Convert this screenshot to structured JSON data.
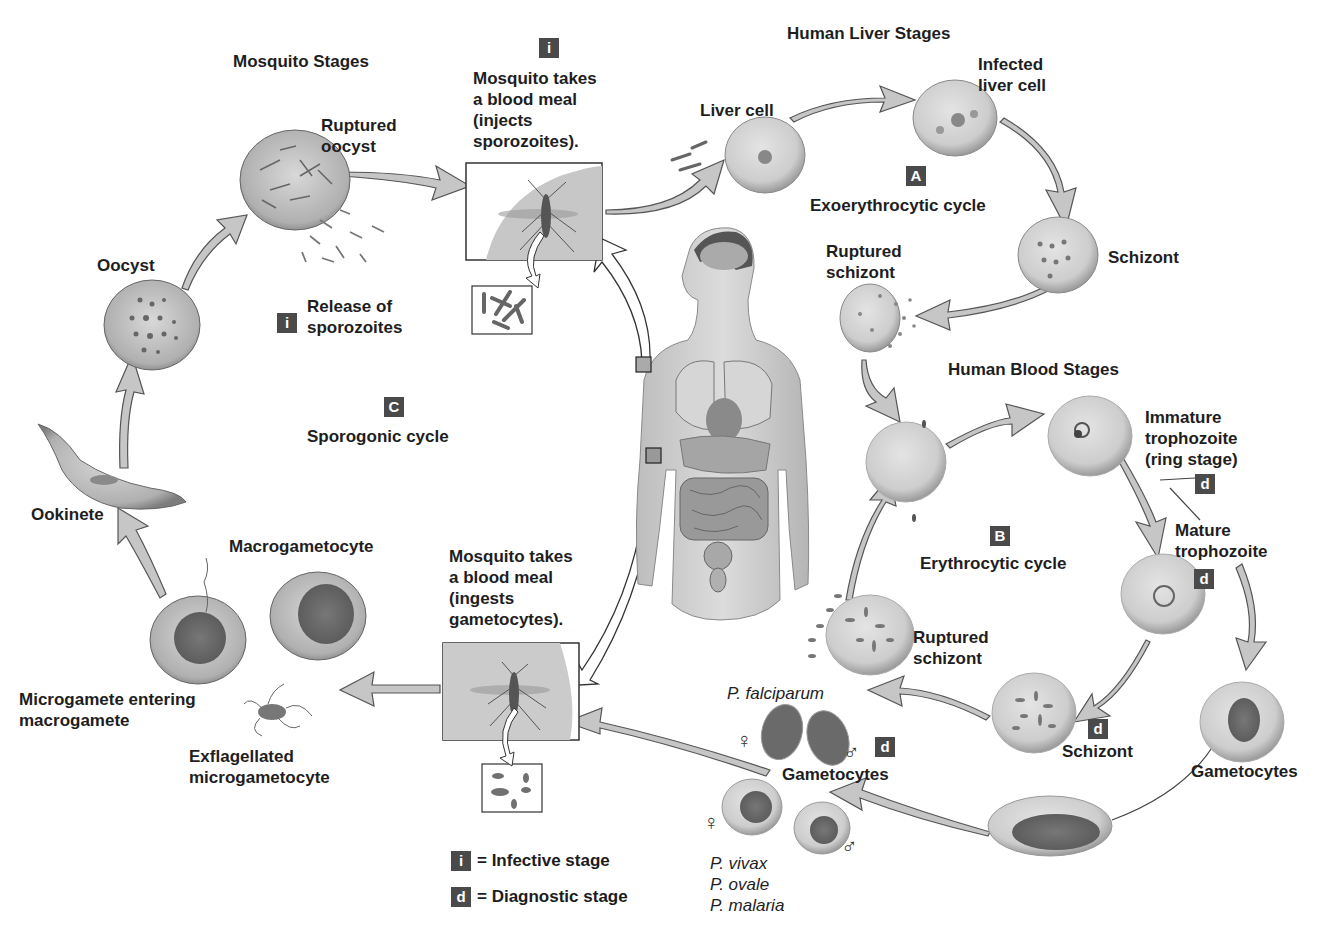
{
  "sections": {
    "mosquito": "Mosquito Stages",
    "liver": "Human Liver Stages",
    "blood": "Human Blood Stages"
  },
  "cycles": {
    "A": {
      "badge": "A",
      "label": "Exoerythrocytic cycle"
    },
    "B": {
      "badge": "B",
      "label": "Erythrocytic cycle"
    },
    "C": {
      "badge": "C",
      "label": "Sporogonic cycle"
    }
  },
  "labels": {
    "bite_inject": [
      "Mosquito takes",
      "a blood meal",
      "(injects",
      "sporozoites)."
    ],
    "bite_ingest": [
      "Mosquito takes",
      "a blood meal",
      "(ingests",
      "gametocytes)."
    ],
    "liver_cell": "Liver cell",
    "infected_liver_cell": [
      "Infected",
      "liver cell"
    ],
    "schizont_liver": "Schizont",
    "ruptured_schizont_liver": [
      "Ruptured",
      "schizont"
    ],
    "immature_trophozoite": [
      "Immature",
      "trophozoite",
      "(ring stage)"
    ],
    "mature_trophozoite": [
      "Mature",
      "trophozoite"
    ],
    "schizont_blood": "Schizont",
    "ruptured_schizont_blood": [
      "Ruptured",
      "schizont"
    ],
    "gametocytes_right": "Gametocytes",
    "gametocytes_center": "Gametocytes",
    "p_falciparum": "P. falciparum",
    "species_other": [
      "P. vivax",
      "P. ovale",
      "P. malaria"
    ],
    "ruptured_oocyst": [
      "Ruptured",
      "oocyst"
    ],
    "release_sporozoites": [
      "Release of",
      "sporozoites"
    ],
    "oocyst": "Oocyst",
    "ookinete": "Ookinete",
    "macrogametocyte": "Macrogametocyte",
    "microgamete_entering": [
      "Microgamete entering",
      "macrogamete"
    ],
    "exflagellated": [
      "Exflagellated",
      "microgametocyte"
    ]
  },
  "badges": {
    "infective": "i",
    "diagnostic": "d"
  },
  "symbols": {
    "female": "♀",
    "male": "♂"
  },
  "legend": [
    {
      "badge": "i",
      "text": "= Infective stage"
    },
    {
      "badge": "d",
      "text": "= Diagnostic stage"
    }
  ],
  "colors": {
    "badge_bg": "#4a4a4a",
    "arrow_fill": "#c4c4c4",
    "cell": "#cfcfcf"
  }
}
